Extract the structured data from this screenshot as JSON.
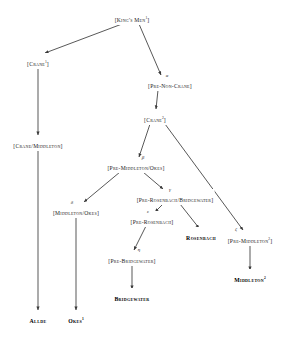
{
  "diagram": {
    "type": "stemma",
    "line_color": "#3a3a3a",
    "text_color": "#1a1a1a",
    "background": "#ffffff"
  },
  "nodes": [
    {
      "id": "kings-men-1",
      "label": "[King's Men",
      "sup": "1",
      "close": "]",
      "kind": "hypothetical",
      "x": 132,
      "y": 17
    },
    {
      "id": "crane-1",
      "label": "[Crane",
      "sup": "1",
      "close": "]",
      "kind": "hypothetical",
      "x": 38,
      "y": 61
    },
    {
      "id": "pre-non-crane",
      "label": "[Pre-Non-Crane]",
      "sup": "",
      "close": "",
      "kind": "hypothetical",
      "x": 170,
      "y": 83
    },
    {
      "id": "crane-2",
      "label": "[Crane",
      "sup": "2",
      "close": "]",
      "kind": "hypothetical",
      "x": 155,
      "y": 117
    },
    {
      "id": "crane-middleton",
      "label": "[Crane/Middleton]",
      "sup": "",
      "close": "",
      "kind": "hypothetical",
      "x": 38,
      "y": 143
    },
    {
      "id": "pre-middleton-okes",
      "label": "[Pre-Middleton/Okes]",
      "sup": "",
      "close": "",
      "kind": "hypothetical",
      "x": 136,
      "y": 165
    },
    {
      "id": "middleton-okes",
      "label": "[Middleton/Okes]",
      "sup": "",
      "close": "",
      "kind": "hypothetical",
      "x": 76,
      "y": 210
    },
    {
      "id": "pre-rosenbach-bridgewater",
      "label": "[Pre-Rosenbach/Bridgewater]",
      "sup": "",
      "close": "",
      "kind": "hypothetical",
      "x": 175,
      "y": 197
    },
    {
      "id": "pre-rosenbach",
      "label": "[Pre-Rosenbach]",
      "sup": "",
      "close": "",
      "kind": "hypothetical",
      "x": 152,
      "y": 219
    },
    {
      "id": "rosenbach",
      "label": "Rosenbach",
      "sup": "",
      "close": "",
      "kind": "witness",
      "x": 201,
      "y": 235
    },
    {
      "id": "pre-bridgewater",
      "label": "[Pre-Bridgewater]",
      "sup": "",
      "close": "",
      "kind": "hypothetical",
      "x": 132,
      "y": 258
    },
    {
      "id": "pre-middleton-2",
      "label": "[Pre-Middleton",
      "sup": "2",
      "close": "]",
      "kind": "hypothetical",
      "x": 250,
      "y": 238
    },
    {
      "id": "bridgewater",
      "label": "Bridgewater",
      "sup": "",
      "close": "",
      "kind": "witness",
      "x": 132,
      "y": 296
    },
    {
      "id": "middleton-2",
      "label": "Middleton",
      "sup": "2",
      "close": "",
      "kind": "witness",
      "x": 250,
      "y": 277
    },
    {
      "id": "allde",
      "label": "Allde",
      "sup": "",
      "close": "",
      "kind": "witness",
      "x": 38,
      "y": 318
    },
    {
      "id": "okes-1",
      "label": "Okes",
      "sup": "1",
      "close": "",
      "kind": "witness",
      "x": 76,
      "y": 318
    }
  ],
  "edges": [
    {
      "id": "kingsmen-to-crane1",
      "from": "kings-men-1",
      "to": "crane-1",
      "x1": 122,
      "y1": 24,
      "x2": 45,
      "y2": 53
    },
    {
      "id": "kingsmen-to-prenoncrane",
      "from": "kings-men-1",
      "to": "pre-non-crane",
      "x1": 139,
      "y1": 24,
      "x2": 161,
      "y2": 75
    },
    {
      "id": "crane1-to-cranemiddleton",
      "from": "crane-1",
      "to": "crane-middleton",
      "x1": 38,
      "y1": 68,
      "x2": 38,
      "y2": 135
    },
    {
      "id": "prenoncrane-to-crane2",
      "from": "pre-non-crane",
      "to": "crane-2",
      "x1": 158,
      "y1": 90,
      "x2": 156,
      "y2": 109
    },
    {
      "id": "cranemiddleton-to-allde",
      "from": "crane-middleton",
      "to": "allde",
      "x1": 38,
      "y1": 150,
      "x2": 38,
      "y2": 310
    },
    {
      "id": "crane2-to-premiddletonokes",
      "from": "crane-2",
      "to": "pre-middleton-okes",
      "x1": 150,
      "y1": 124,
      "x2": 139,
      "y2": 157
    },
    {
      "id": "crane2-to-premiddleton2",
      "from": "crane-2",
      "to": "pre-middleton-2",
      "x1": 165,
      "y1": 124,
      "x2": 243,
      "y2": 230
    },
    {
      "id": "pmo-to-middletonokes",
      "from": "pre-middleton-okes",
      "to": "middleton-okes",
      "x1": 120,
      "y1": 172,
      "x2": 84,
      "y2": 202
    },
    {
      "id": "pmo-to-prb",
      "from": "pre-middleton-okes",
      "to": "pre-rosenbach-bridgewater",
      "x1": 143,
      "y1": 172,
      "x2": 163,
      "y2": 189
    },
    {
      "id": "middletonokes-to-okes1",
      "from": "middleton-okes",
      "to": "okes-1",
      "x1": 76,
      "y1": 217,
      "x2": 76,
      "y2": 310
    },
    {
      "id": "prb-to-prerosenbach",
      "from": "pre-rosenbach-bridgewater",
      "to": "pre-rosenbach",
      "x1": 163,
      "y1": 204,
      "x2": 155,
      "y2": 212
    },
    {
      "id": "prb-to-rosenbach",
      "from": "pre-rosenbach-bridgewater",
      "to": "rosenbach",
      "x1": 180,
      "y1": 204,
      "x2": 199,
      "y2": 228
    },
    {
      "id": "prerosenbach-to-prebridge",
      "from": "pre-rosenbach",
      "to": "pre-bridgewater",
      "x1": 146,
      "y1": 226,
      "x2": 134,
      "y2": 250
    },
    {
      "id": "prebridge-to-bridgewater",
      "from": "pre-bridgewater",
      "to": "bridgewater",
      "x1": 132,
      "y1": 265,
      "x2": 132,
      "y2": 289
    },
    {
      "id": "premiddleton2-to-mid2",
      "from": "pre-middleton-2",
      "to": "middleton-2",
      "x1": 250,
      "y1": 245,
      "x2": 250,
      "y2": 270
    }
  ],
  "edge_labels": [
    {
      "id": "alpha-label",
      "text": "α",
      "edge": "kingsmen-to-prenoncrane",
      "x": 167,
      "y": 75
    },
    {
      "id": "beta-label",
      "text": "β",
      "edge": "crane2-to-premiddletonokes",
      "x": 143,
      "y": 157
    },
    {
      "id": "gamma-label",
      "text": "γ",
      "edge": "pmo-to-prb",
      "x": 170,
      "y": 189
    },
    {
      "id": "delta-label",
      "text": "δ",
      "edge": "pmo-to-middletonokes",
      "x": 72,
      "y": 202
    },
    {
      "id": "epsilon-label",
      "text": "ε",
      "edge": "prb-to-prerosenbach",
      "x": 148,
      "y": 211
    },
    {
      "id": "zeta-label",
      "text": "ζ",
      "edge": "crane2-to-premiddleton2",
      "x": 236,
      "y": 229
    },
    {
      "id": "eta-label",
      "text": "η",
      "edge": "prerosenbach-to-prebridge",
      "x": 139,
      "y": 249
    }
  ]
}
